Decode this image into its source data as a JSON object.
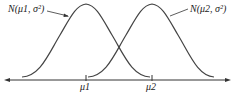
{
  "diagram": {
    "curves": [
      {
        "label": "N(μ1, σ²)",
        "mean_label": "μ1"
      },
      {
        "label": "N(μ2, σ²)",
        "mean_label": "μ2"
      }
    ],
    "axis": {
      "ticks": [
        "μ1",
        "μ2"
      ]
    },
    "colors": {
      "stroke": "#333333",
      "background": "#ffffff"
    }
  }
}
